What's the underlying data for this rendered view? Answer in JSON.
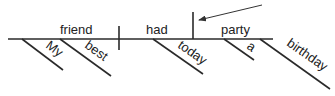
{
  "diagram": {
    "type": "sentence-diagram",
    "sentence_parts": {
      "subject": "friend",
      "verb": "had",
      "direct_object": "party"
    },
    "modifiers": {
      "subject_modifiers": [
        "My",
        "best"
      ],
      "verb_modifiers": [
        "today"
      ],
      "object_modifiers": [
        "a",
        "birthday"
      ]
    },
    "colors": {
      "line": "#2a2a2a",
      "text": "#222222",
      "background": "#ffffff"
    }
  }
}
